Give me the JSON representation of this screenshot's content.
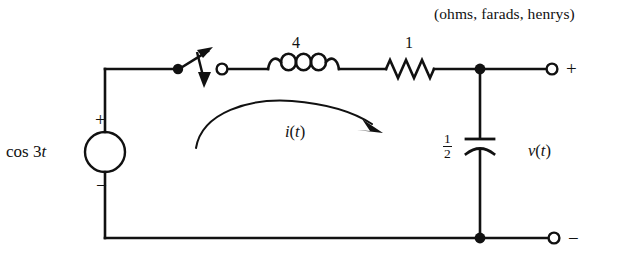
{
  "diagram": {
    "title_note": "(ohms, farads, henrys)",
    "type": "electrical-circuit-schematic",
    "source": {
      "label_prefix": "cos 3",
      "label_var": "t",
      "plus_sign": "+",
      "minus_sign": "−",
      "shape": "circle"
    },
    "switch": {
      "name": "switch",
      "state": "open"
    },
    "inductor": {
      "value": "4",
      "unit": "henrys"
    },
    "resistor": {
      "value": "1",
      "unit": "ohms"
    },
    "capacitor": {
      "numerator": "1",
      "denominator": "2",
      "unit": "farads"
    },
    "mesh_current": {
      "label_fn": "i",
      "label_open": "(",
      "label_var": "t",
      "label_close": ")",
      "direction": "clockwise"
    },
    "output_voltage": {
      "label_fn": "v",
      "label_open": "(",
      "label_var": "t",
      "label_close": ")"
    },
    "terminals": {
      "top_right_sign": "+",
      "bottom_right_sign": "−"
    },
    "colors": {
      "wire": "#111111",
      "background": "#ffffff",
      "text": "#111111"
    }
  }
}
